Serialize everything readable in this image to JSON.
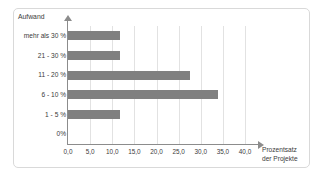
{
  "chart_data": {
    "type": "bar",
    "orientation": "horizontal",
    "title": "",
    "xlabel": "Prozentsatz der Projekte",
    "xlabel_lines": [
      "Prozentsatz",
      "der Projekte"
    ],
    "ylabel": "Aufwand",
    "categories": [
      "0%",
      "1 - 5 %",
      "6 - 10 %",
      "11 - 20 %",
      "21 - 30 %",
      "mehr als 30 %"
    ],
    "values": [
      0,
      11.7,
      34.0,
      27.5,
      11.7,
      11.7
    ],
    "xlim": [
      0,
      40
    ],
    "ylim": [
      0,
      6
    ],
    "xticks": [
      0,
      5,
      10,
      15,
      20,
      25,
      30,
      35,
      40
    ],
    "xticklabels": [
      "0,0",
      "5,0",
      "10,0",
      "15,0",
      "20,0",
      "25,0",
      "30,0",
      "35,0",
      "40,0"
    ],
    "grid": "vertical",
    "legend": "none",
    "bar_color": "#808080",
    "gridline_color": "#e2e2e2",
    "axis_color": "#8c8c8c",
    "border_color": "#d9d9d9",
    "background_color": "#ffffff"
  }
}
